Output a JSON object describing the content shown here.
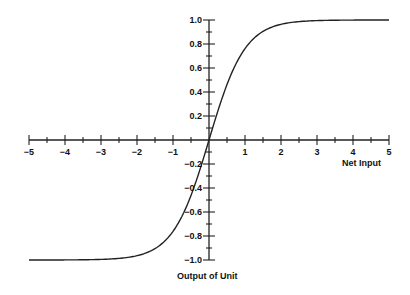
{
  "chart_data": {
    "type": "line",
    "title": "",
    "xlabel": "Net Input",
    "ylabel": "Output of Unit",
    "xlim": [
      -5,
      5
    ],
    "ylim": [
      -1.0,
      1.0
    ],
    "grid": false,
    "legend": null,
    "x_ticks": [
      "-5",
      "-4",
      "-3",
      "-2",
      "-1",
      "1",
      "2",
      "3",
      "4",
      "5"
    ],
    "y_ticks": [
      "1.0",
      "0.8",
      "0.6",
      "0.4",
      "0.2",
      "-0.2",
      "-0.4",
      "-0.6",
      "-0.8",
      "-1.0"
    ],
    "series": [
      {
        "name": "tanh",
        "x": [
          -5,
          -4,
          -3,
          -2.5,
          -2,
          -1.5,
          -1,
          -0.5,
          0,
          0.5,
          1,
          1.5,
          2,
          2.5,
          3,
          4,
          5
        ],
        "y": [
          -0.9999,
          -0.9993,
          -0.9951,
          -0.9866,
          -0.964,
          -0.9051,
          -0.7616,
          -0.4621,
          0,
          0.4621,
          0.7616,
          0.9051,
          0.964,
          0.9866,
          0.9951,
          0.9993,
          0.9999
        ]
      }
    ]
  }
}
